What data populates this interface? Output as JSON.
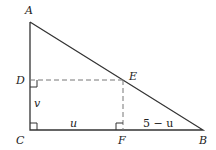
{
  "diagram": {
    "colors": {
      "line": "#333333",
      "dashed": "#777777",
      "background": "#ffffff"
    },
    "points": {
      "A": {
        "label": "A",
        "x": 30,
        "y": 22
      },
      "B": {
        "label": "B",
        "x": 203,
        "y": 130
      },
      "C": {
        "label": "C",
        "x": 30,
        "y": 130
      },
      "D": {
        "label": "D",
        "x": 30,
        "y": 80
      },
      "E": {
        "label": "E",
        "x": 123,
        "y": 80
      },
      "F": {
        "label": "F",
        "x": 123,
        "y": 130
      }
    },
    "segment_labels": {
      "v": "v",
      "u": "u",
      "five_minus_u": "5 − u"
    },
    "right_angle_marks": [
      "C",
      "D",
      "F"
    ]
  }
}
